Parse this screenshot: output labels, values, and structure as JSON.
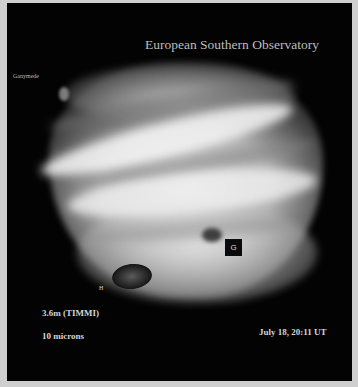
{
  "image": {
    "subject": "Jupiter infrared image with comet impact sites",
    "title": "European Southern Observatory",
    "annotations": {
      "moon_label": "Ganymede",
      "impact_site_g": "G",
      "impact_site_h": "H"
    },
    "instrument": "3.6m (TIMMI)",
    "wavelength": "10 microns",
    "timestamp": "July 18, 20:11 UT"
  },
  "colors": {
    "background": "#030303",
    "frame": "#cfcfcf",
    "text": "#cfcfcf"
  }
}
